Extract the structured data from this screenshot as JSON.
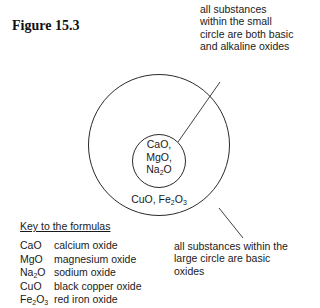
{
  "figure": {
    "title": "Figure 15.3"
  },
  "annotations": {
    "small_circle_note": "all substances within the small circle are both basic and alkaline oxides",
    "large_circle_note": "all substances within the large circle are basic oxides"
  },
  "diagram": {
    "outer_circle": {
      "label": "Basic oxides",
      "contents": [
        "CuO",
        "Fe2O3"
      ]
    },
    "inner_circle": {
      "label": "Basic and alkaline oxides",
      "contents": [
        "CaO",
        "MgO",
        "Na2O"
      ]
    },
    "line_color": "#2a2a2a"
  },
  "key": {
    "title": "Key to the formulas",
    "rows": [
      {
        "formula": "CaO",
        "name": "calcium oxide"
      },
      {
        "formula": "MgO",
        "name": "magnesium oxide"
      },
      {
        "formula": "Na2O",
        "name": "sodium oxide"
      },
      {
        "formula": "CuO",
        "name": "black copper oxide"
      },
      {
        "formula": "Fe2O3",
        "name": "red iron oxide"
      }
    ]
  }
}
